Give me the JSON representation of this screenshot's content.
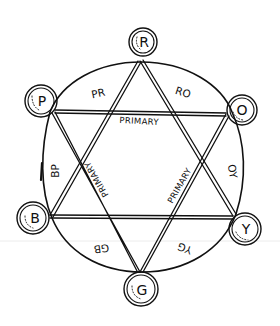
{
  "diagram": {
    "title": "",
    "nodes": [
      {
        "id": "R",
        "label": "R",
        "name": "red"
      },
      {
        "id": "O",
        "label": "O",
        "name": "orange"
      },
      {
        "id": "Y",
        "label": "Y",
        "name": "yellow"
      },
      {
        "id": "G",
        "label": "G",
        "name": "green"
      },
      {
        "id": "B",
        "label": "B",
        "name": "blue"
      },
      {
        "id": "P",
        "label": "P",
        "name": "purple"
      }
    ],
    "arc_labels": [
      {
        "between": [
          "P",
          "R"
        ],
        "label": "PR"
      },
      {
        "between": [
          "R",
          "O"
        ],
        "label": "RO"
      },
      {
        "between": [
          "O",
          "Y"
        ],
        "label": "OY"
      },
      {
        "between": [
          "Y",
          "G"
        ],
        "label": "YG"
      },
      {
        "between": [
          "G",
          "B"
        ],
        "label": "GB"
      },
      {
        "between": [
          "B",
          "P"
        ],
        "label": "BP"
      }
    ],
    "triangle_labels": {
      "top": "PRIMARY",
      "left": "PRIMARY",
      "right": "PRIMARY"
    },
    "triangles": [
      {
        "vertices": [
          "R",
          "Y",
          "B"
        ]
      },
      {
        "vertices": [
          "P",
          "O",
          "G"
        ]
      }
    ]
  }
}
